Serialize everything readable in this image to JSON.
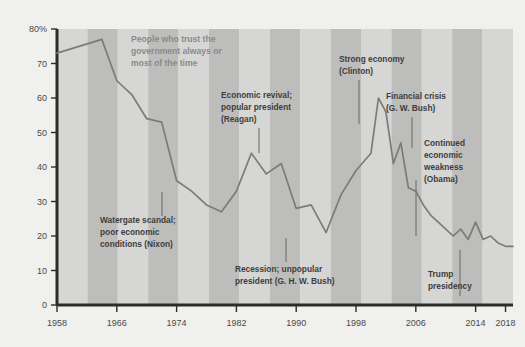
{
  "chart_data": {
    "type": "line",
    "title": "",
    "subtitle": "",
    "xlabel": "",
    "ylabel": "",
    "xlim": [
      1958,
      2019
    ],
    "ylim": [
      0,
      80
    ],
    "yticks": [
      0,
      10,
      20,
      30,
      40,
      50,
      60,
      70,
      80
    ],
    "ytick_labels": [
      "0",
      "10",
      "20",
      "30",
      "40",
      "50",
      "60",
      "70",
      "80%"
    ],
    "xticks": [
      1958,
      1966,
      1974,
      1982,
      1990,
      1998,
      2006,
      2014,
      2018
    ],
    "xtick_labels": [
      "1958",
      "1966",
      "1974",
      "1982",
      "1990",
      "1998",
      "2006",
      "2014",
      "2018"
    ],
    "grid": false,
    "legend": "none",
    "line_color": "#7b7b7b",
    "series": [
      {
        "name": "People who trust the government always or most of the time",
        "x": [
          1958,
          1964,
          1966,
          1968,
          1970,
          1972,
          1974,
          1976,
          1978,
          1980,
          1982,
          1984,
          1986,
          1988,
          1990,
          1992,
          1994,
          1996,
          1998,
          2000,
          2001,
          2002,
          2003,
          2004,
          2005,
          2006,
          2007,
          2008,
          2009,
          2010,
          2011,
          2012,
          2013,
          2014,
          2015,
          2016,
          2017,
          2018,
          2019
        ],
        "values": [
          73,
          77,
          65,
          61,
          54,
          53,
          36,
          33,
          29,
          27,
          33,
          44,
          38,
          41,
          28,
          29,
          21,
          32,
          39,
          44,
          60,
          56,
          41,
          47,
          34,
          33,
          29,
          26,
          24,
          22,
          20,
          22,
          19,
          24,
          19,
          20,
          18,
          17,
          17
        ]
      }
    ],
    "annotations": [
      {
        "id": "series-label",
        "text": "People who trust the\ngovernment always or\nmost of the time",
        "style": "subtle"
      },
      {
        "id": "watergate",
        "text": "Watergate scandal;\npoor economic\nconditions (Nixon)",
        "style": "dark"
      },
      {
        "id": "reagan",
        "text": "Economic revival;\npopular president\n(Reagan)",
        "style": "dark"
      },
      {
        "id": "ghw-bush",
        "text": "Recession; unpopular\npresident (G. H. W. Bush)",
        "style": "dark"
      },
      {
        "id": "clinton",
        "text": "Strong economy\n(Clinton)",
        "style": "dark"
      },
      {
        "id": "gw-bush",
        "text": "Financial crisis\n(G. W. Bush)",
        "style": "dark"
      },
      {
        "id": "obama",
        "text": "Continued\neconomic\nweakness\n(Obama)",
        "style": "dark"
      },
      {
        "id": "trump",
        "text": "Trump\npresidency",
        "style": "dark"
      }
    ],
    "bands": [
      {
        "label": "band-1",
        "shade": "light"
      },
      {
        "label": "band-2",
        "shade": "dark"
      },
      {
        "label": "band-3",
        "shade": "light"
      },
      {
        "label": "band-4",
        "shade": "dark"
      },
      {
        "label": "band-5",
        "shade": "light"
      },
      {
        "label": "band-6",
        "shade": "dark"
      },
      {
        "label": "band-7",
        "shade": "light"
      },
      {
        "label": "band-8",
        "shade": "dark"
      },
      {
        "label": "band-9",
        "shade": "light"
      },
      {
        "label": "band-10",
        "shade": "dark"
      },
      {
        "label": "band-11",
        "shade": "light"
      },
      {
        "label": "band-12",
        "shade": "dark"
      },
      {
        "label": "band-13",
        "shade": "light"
      },
      {
        "label": "band-14",
        "shade": "dark"
      },
      {
        "label": "band-15",
        "shade": "light"
      }
    ],
    "colors": {
      "page_background": "#f0f0ee",
      "plot_band_light": "#d6d6d4",
      "plot_band_dark": "#bdbdbb",
      "line": "#7b7b7b",
      "axis": "#2b2b2b",
      "annotation_dark": "#3d3d3d",
      "annotation_subtle": "#8a8a8a"
    }
  },
  "annotation_text": {
    "series_label": {
      "l1": "People who trust the",
      "l2": "government always or",
      "l3": "most of the time"
    },
    "watergate": {
      "l1": "Watergate scandal;",
      "l2": "poor economic",
      "l3": "conditions (Nixon)"
    },
    "reagan": {
      "l1": "Economic revival;",
      "l2": "popular president",
      "l3": "(Reagan)"
    },
    "ghw_bush": {
      "l1": "Recession; unpopular",
      "l2": "president (G. H. W. Bush)"
    },
    "clinton": {
      "l1": "Strong economy",
      "l2": "(Clinton)"
    },
    "gw_bush": {
      "l1": "Financial crisis",
      "l2": "(G. W. Bush)"
    },
    "obama": {
      "l1": "Continued",
      "l2": "economic",
      "l3": "weakness",
      "l4": "(Obama)"
    },
    "trump": {
      "l1": "Trump",
      "l2": "presidency"
    }
  },
  "axis_labels": {
    "y": [
      "80%",
      "70",
      "60",
      "50",
      "40",
      "30",
      "20",
      "10",
      "0"
    ],
    "x": [
      "1958",
      "1966",
      "1974",
      "1982",
      "1990",
      "1998",
      "2006",
      "2014",
      "2018"
    ]
  }
}
